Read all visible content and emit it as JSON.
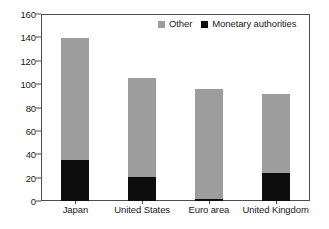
{
  "chart_data": {
    "type": "bar",
    "subtype": "stacked-vertical",
    "title": "",
    "subtitle": "",
    "xlabel": "",
    "ylabel": "",
    "ylim": [
      0,
      160
    ],
    "yticks": [
      0,
      20,
      40,
      60,
      80,
      100,
      120,
      140,
      160
    ],
    "ytick_labels": [
      "0",
      "20",
      "40",
      "60",
      "80",
      "100",
      "120",
      "140",
      "160"
    ],
    "grid": false,
    "legend_position": "top-right-inside",
    "categories": [
      "Japan",
      "United States",
      "Euro area",
      "United Kingdom"
    ],
    "series": [
      {
        "name": "Monetary authorities",
        "color": "#0d0d0d",
        "values": [
          35,
          21,
          2,
          24
        ]
      },
      {
        "name": "Other",
        "color": "#9d9d9d",
        "values": [
          105,
          85,
          94,
          68
        ]
      }
    ],
    "totals": [
      140,
      106,
      96,
      92
    ],
    "stack_order": [
      "Monetary authorities",
      "Other"
    ]
  },
  "legend": {
    "entries": [
      {
        "label": "Other",
        "color": "#9d9d9d"
      },
      {
        "label": "Monetary authorities",
        "color": "#0d0d0d"
      }
    ]
  },
  "axes": {
    "frame_color": "#4d4d4d",
    "text_color": "#1a1a1a"
  }
}
